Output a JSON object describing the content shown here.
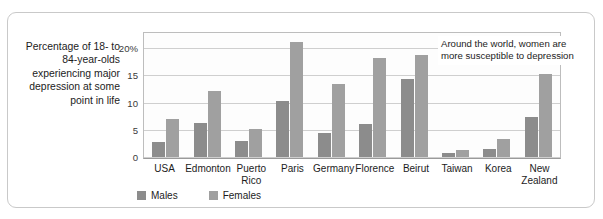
{
  "chart_data": {
    "type": "bar",
    "title": "",
    "subtitle": "",
    "xlabel": "",
    "ylabel": "Percentage of 18- to 84-year-olds experiencing major depression at some point in life",
    "ylim": [
      0,
      23
    ],
    "ytick_labels": [
      "20%",
      "15",
      "10",
      "5",
      "0"
    ],
    "ytick_values": [
      20,
      15,
      10,
      5,
      0
    ],
    "grid": true,
    "legend_position": "bottom-left",
    "categories": [
      "USA",
      "Edmonton",
      "Puerto Rico",
      "Paris",
      "Germany",
      "Florence",
      "Beirut",
      "Taiwan",
      "Korea",
      "New Zealand"
    ],
    "series": [
      {
        "name": "Males",
        "color": "#8c8c8c",
        "values": [
          2.8,
          6.3,
          3.0,
          10.5,
          4.4,
          6.2,
          14.5,
          0.8,
          1.5,
          7.5
        ]
      },
      {
        "name": "Females",
        "color": "#a0a0a0",
        "values": [
          7.2,
          12.3,
          5.3,
          21.5,
          13.6,
          18.5,
          19.0,
          1.4,
          3.3,
          15.5
        ]
      }
    ],
    "annotations": [
      {
        "text": "Around the world, women are more susceptible to depression"
      }
    ]
  },
  "caption": {
    "y_axis_caption": "Percentage of 18- to 84-year-olds experiencing major depression at some point in life"
  },
  "legend": {
    "items": [
      {
        "label": "Males"
      },
      {
        "label": "Females"
      }
    ]
  },
  "annotation": {
    "text": "Around the world, women are more susceptible to depression"
  }
}
